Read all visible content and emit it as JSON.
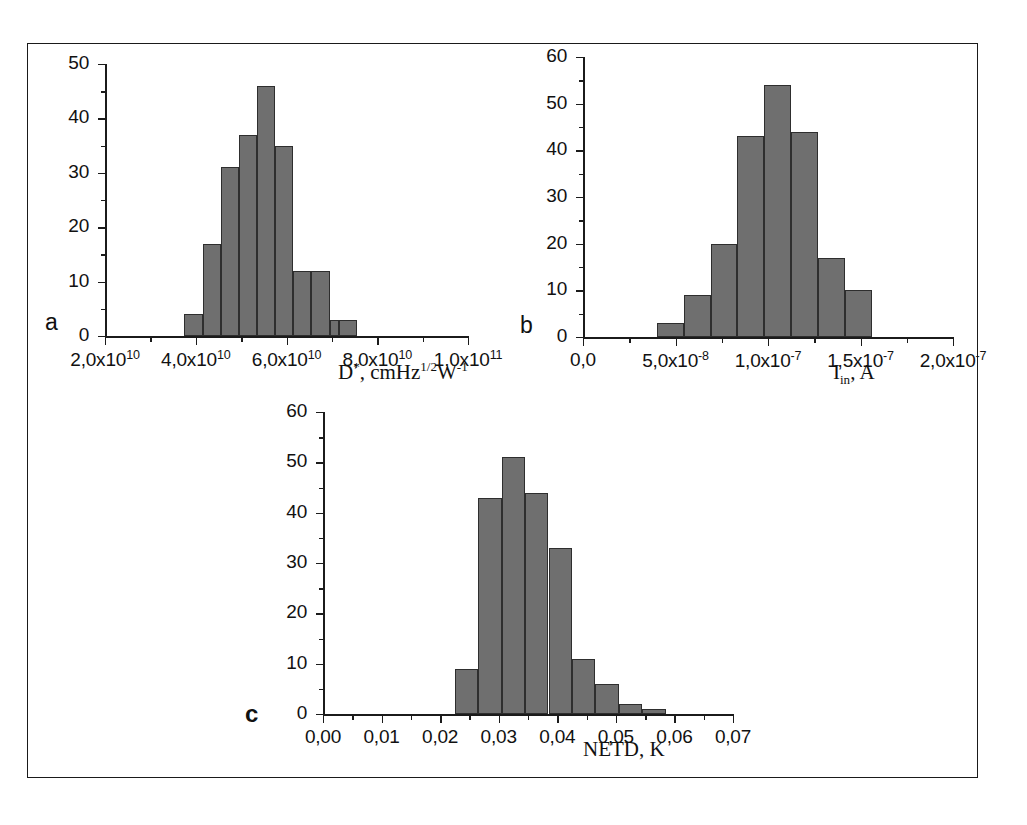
{
  "figure": {
    "background_color": "#ffffff",
    "frame_color": "#1a1a1a",
    "bar_fill_color": "#6f6f6f",
    "bar_edge_color": "#2e2e2e",
    "axis_color": "#1b1b1b"
  },
  "panels": {
    "a": {
      "letter": "a",
      "axis_title_html": "D<sup>*</sup>, cmHz<sup>1/2</sup>W<sup>-1</sup>",
      "y_ticks": [
        "0",
        "10",
        "20",
        "30",
        "40",
        "50"
      ],
      "x_ticks": [
        "2,0x10",
        "4,0x10",
        "6,0x10",
        "8,0x10",
        "1,0x10"
      ],
      "x_tick_exponents": [
        "10",
        "10",
        "10",
        "10",
        "11"
      ]
    },
    "b": {
      "letter": "b",
      "axis_title_html": "I<sub>in</sub>, A",
      "y_ticks": [
        "0",
        "10",
        "20",
        "30",
        "40",
        "50",
        "60"
      ],
      "x_ticks": [
        "0,0",
        "5,0x10",
        "1,0x10",
        "1,5x10",
        "2,0x10"
      ],
      "x_tick_exponents": [
        "",
        "-8",
        "-7",
        "-7",
        "-7"
      ]
    },
    "c": {
      "letter": "c",
      "axis_title_html": "NETD, K",
      "y_ticks": [
        "0",
        "10",
        "20",
        "30",
        "40",
        "50",
        "60"
      ],
      "x_ticks": [
        "0,00",
        "0,01",
        "0,02",
        "0,03",
        "0,04",
        "0,05",
        "0,06",
        "0,07"
      ],
      "x_tick_exponents": [
        "",
        "",
        "",
        "",
        "",
        "",
        "",
        ""
      ]
    }
  },
  "chart_data": [
    {
      "type": "bar",
      "panel": "a",
      "title": "",
      "xlabel": "D*, cmHz^1/2 W^-1",
      "ylabel": "",
      "ylim": [
        0,
        50
      ],
      "xlim": [
        20000000000.0,
        100000000000.0
      ],
      "grid": false,
      "legend": "none",
      "xtick_values": [
        20000000000.0,
        40000000000.0,
        60000000000.0,
        80000000000.0,
        100000000000.0
      ],
      "xtick_labels": [
        "2,0x10^10",
        "4,0x10^10",
        "6,0x10^10",
        "8,0x10^10",
        "1,0x10^11"
      ],
      "ytick_values": [
        0,
        10,
        20,
        30,
        40,
        50
      ],
      "ytick_labels": [
        "0",
        "10",
        "20",
        "30",
        "40",
        "50"
      ],
      "bin_edges": [
        37500000000.0,
        41500000000.0,
        45500000000.0,
        49500000000.0,
        53500000000.0,
        57500000000.0,
        61500000000.0,
        65500000000.0,
        69500000000.0,
        71500000000.0,
        75500000000.0
      ],
      "bin_centers": [
        39500000000.0,
        43500000000.0,
        47500000000.0,
        51500000000.0,
        55500000000.0,
        59500000000.0,
        63500000000.0,
        67500000000.0,
        70500000000.0,
        73500000000.0
      ],
      "values": [
        4,
        17,
        31,
        37,
        46,
        35,
        12,
        12,
        3,
        3
      ]
    },
    {
      "type": "bar",
      "panel": "b",
      "title": "",
      "xlabel": "I_in, A",
      "ylabel": "",
      "ylim": [
        0,
        60
      ],
      "xlim": [
        0.0,
        2e-07
      ],
      "grid": false,
      "legend": "none",
      "xtick_values": [
        0.0,
        5e-08,
        1e-07,
        1.5e-07,
        2e-07
      ],
      "xtick_labels": [
        "0,0",
        "5,0x10^-8",
        "1,0x10^-7",
        "1,5x10^-7",
        "2,0x10^-7"
      ],
      "ytick_values": [
        0,
        10,
        20,
        30,
        40,
        50,
        60
      ],
      "ytick_labels": [
        "0",
        "10",
        "20",
        "30",
        "40",
        "50",
        "60"
      ],
      "bin_edges": [
        4e-08,
        5.45e-08,
        6.9e-08,
        8.35e-08,
        9.8e-08,
        1.125e-07,
        1.27e-07,
        1.415e-07,
        1.56e-07
      ],
      "bin_centers": [
        4.7e-08,
        6.2e-08,
        7.6e-08,
        9.1e-08,
        1.05e-07,
        1.2e-07,
        1.34e-07,
        1.49e-07
      ],
      "values": [
        3,
        9,
        20,
        43,
        54,
        44,
        17,
        10
      ]
    },
    {
      "type": "bar",
      "panel": "c",
      "title": "",
      "xlabel": "NETD, K",
      "ylabel": "",
      "ylim": [
        0,
        60
      ],
      "xlim": [
        0.0,
        0.07
      ],
      "grid": false,
      "legend": "none",
      "xtick_values": [
        0.0,
        0.01,
        0.02,
        0.03,
        0.04,
        0.05,
        0.06,
        0.07
      ],
      "xtick_labels": [
        "0,00",
        "0,01",
        "0,02",
        "0,03",
        "0,04",
        "0,05",
        "0,06",
        "0,07"
      ],
      "ytick_values": [
        0,
        10,
        20,
        30,
        40,
        50,
        60
      ],
      "ytick_labels": [
        "0",
        "10",
        "20",
        "30",
        "40",
        "50",
        "60"
      ],
      "bin_edges": [
        0.0225,
        0.0265,
        0.0305,
        0.0345,
        0.0385,
        0.0425,
        0.0465,
        0.0505,
        0.0545,
        0.0585,
        0.0625
      ],
      "bin_centers": [
        0.0245,
        0.0285,
        0.0325,
        0.0365,
        0.0405,
        0.0445,
        0.0485,
        0.0525,
        0.0565,
        0.0605
      ],
      "values": [
        9,
        43,
        51,
        44,
        33,
        11,
        6,
        2,
        1,
        0
      ]
    }
  ]
}
